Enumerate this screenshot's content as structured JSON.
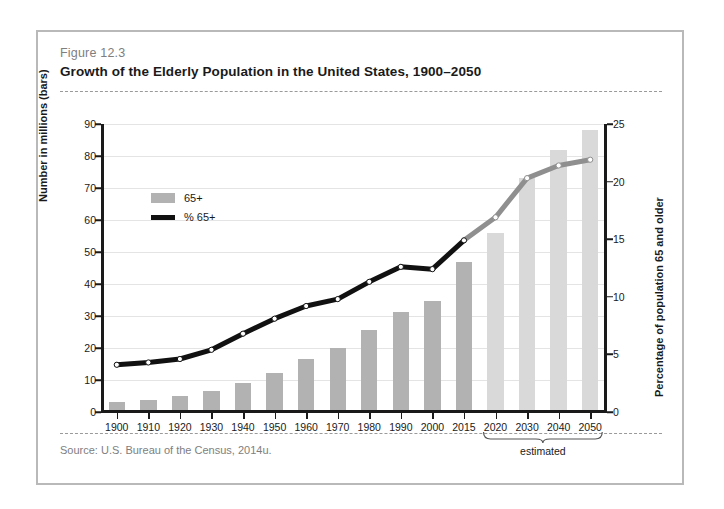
{
  "figure": {
    "number": "Figure 12.3",
    "title": "Growth of the Elderly Population in the United States, 1900–2050",
    "source": "Source:  U.S. Bureau of the Census, 2014u."
  },
  "colors": {
    "bar_actual": "#b2b2b2",
    "bar_estimated": "#d9d9d9",
    "line_actual": "#111111",
    "line_estimated": "#8f8f8f",
    "frame_border": "#b9b9b9",
    "gridline": "#e4e4e4",
    "axis": "#1a1a1a",
    "muted_text": "#7e7e7e"
  },
  "legend": {
    "position": "top-left-inside",
    "items": [
      {
        "marker": "bar-swatch",
        "label": "65+"
      },
      {
        "marker": "line-swatch",
        "label": "% 65+"
      }
    ]
  },
  "annotations": {
    "estimated_label": "estimated",
    "estimated_categories": [
      "2020",
      "2030",
      "2040",
      "2050"
    ]
  },
  "chart_data": {
    "type": "bar",
    "title": "Growth of the Elderly Population in the United States, 1900–2050",
    "xlabel": "",
    "ylabel": "Number in millions (bars)",
    "y2label": "Percentage of population 65 and older",
    "grid": true,
    "ylim": [
      0,
      90
    ],
    "y2lim": [
      0,
      25
    ],
    "yticks": [
      0,
      10,
      20,
      30,
      40,
      50,
      60,
      70,
      80,
      90
    ],
    "y2ticks": [
      0,
      5,
      10,
      15,
      20,
      25
    ],
    "categories": [
      "1900",
      "1910",
      "1920",
      "1930",
      "1940",
      "1950",
      "1960",
      "1970",
      "1980",
      "1990",
      "2000",
      "2015",
      "2020",
      "2030",
      "2040",
      "2050"
    ],
    "series": [
      {
        "name": "65+",
        "kind": "bar",
        "axis": "left",
        "unit": "millions",
        "values": [
          3.1,
          3.9,
          4.9,
          6.6,
          9.0,
          12.3,
          16.6,
          20.0,
          25.5,
          31.2,
          34.7,
          47.0,
          55.9,
          73.1,
          81.9,
          88.0
        ],
        "estimated_from_index": 12
      },
      {
        "name": "% 65+",
        "kind": "line",
        "axis": "right",
        "unit": "percent",
        "values": [
          4.1,
          4.3,
          4.6,
          5.4,
          6.8,
          8.1,
          9.2,
          9.8,
          11.3,
          12.6,
          12.4,
          14.9,
          16.9,
          20.3,
          21.4,
          21.9
        ],
        "estimated_from_index": 12
      }
    ]
  }
}
